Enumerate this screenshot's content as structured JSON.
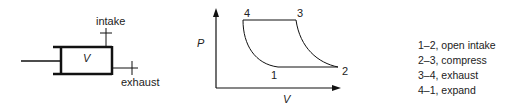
{
  "piston": {
    "volume_label": "V",
    "intake_label": "intake",
    "exhaust_label": "exhaust"
  },
  "pv_diagram": {
    "y_axis_label": "P",
    "x_axis_label": "V",
    "points": [
      {
        "id": "1",
        "label": "1"
      },
      {
        "id": "2",
        "label": "2"
      },
      {
        "id": "3",
        "label": "3"
      },
      {
        "id": "4",
        "label": "4"
      }
    ]
  },
  "legend": {
    "items": [
      {
        "label": "1–2, open intake"
      },
      {
        "label": "2–3, compress"
      },
      {
        "label": "3–4, exhaust"
      },
      {
        "label": "4–1, expand"
      }
    ]
  }
}
